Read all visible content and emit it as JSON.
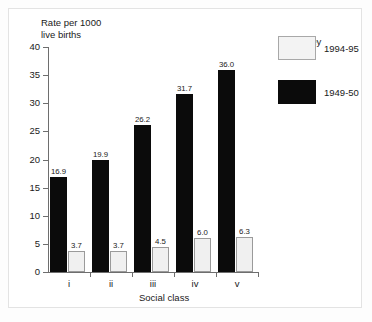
{
  "chart_data": {
    "type": "bar",
    "title": "",
    "xlabel": "Social class",
    "ylabel": "Rate per 1000\nlive births",
    "categories": [
      "i",
      "ii",
      "iii",
      "iv",
      "v"
    ],
    "ylim": [
      0,
      40
    ],
    "yticks": [
      0,
      5,
      10,
      15,
      20,
      25,
      30,
      35,
      40
    ],
    "ytick_labels": [
      "0",
      "5",
      "10",
      "15",
      "20",
      "25",
      "30",
      "35",
      "40"
    ],
    "grid": false,
    "legend_position": "right",
    "legend_title": "Key",
    "series": [
      {
        "name": "1949-50",
        "color": "#0b0b0b",
        "values": [
          16.9,
          19.9,
          26.2,
          31.7,
          36.0
        ],
        "value_labels": [
          "16.9",
          "19.9",
          "26.2",
          "31.7",
          "36.0"
        ]
      },
      {
        "name": "1994-95",
        "color": "#f0f0f0",
        "values": [
          3.7,
          3.7,
          4.5,
          6.0,
          6.3
        ],
        "value_labels": [
          "3.7",
          "3.7",
          "4.5",
          "6.0",
          "6.3"
        ]
      }
    ]
  }
}
